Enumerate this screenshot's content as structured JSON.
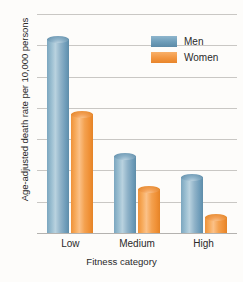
{
  "chart_data": {
    "type": "bar",
    "title": "",
    "subtitle": "",
    "xlabel": "Fitness category",
    "ylabel": "Age-adjusted death rate per 10,000 persons",
    "categories": [
      "Low",
      "Medium",
      "High"
    ],
    "series": [
      {
        "name": "Men",
        "color": "#6d9cb8",
        "values": [
          63,
          25.5,
          19
        ]
      },
      {
        "name": "Women",
        "color": "#f2953f",
        "values": [
          39,
          15,
          6
        ]
      }
    ],
    "ylim": [
      0,
      70
    ],
    "yticks": [
      0,
      10,
      20,
      30,
      40,
      50,
      60,
      70
    ],
    "ytick_labels": [
      "0",
      "10",
      "20",
      "30",
      "40",
      "50",
      "60",
      "70"
    ],
    "grid": true,
    "legend_position": "top-right",
    "style": "3d-cylinder-bars"
  },
  "legend": {
    "entries": [
      {
        "label": "Men"
      },
      {
        "label": "Women"
      }
    ]
  },
  "axes": {
    "y_title": "Age-adjusted death rate per 10,000 persons",
    "x_title": "Fitness category"
  },
  "caption_sliver": ""
}
